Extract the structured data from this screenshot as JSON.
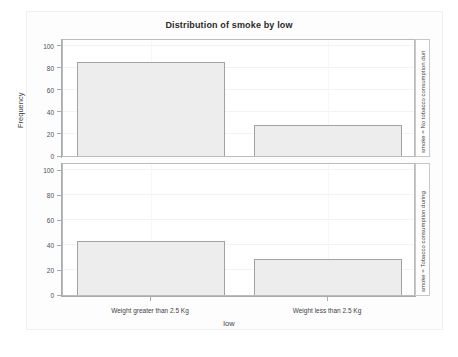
{
  "chart_data": {
    "type": "bar",
    "title": "Distribution of smoke by low",
    "xlabel": "low",
    "ylabel": "Frequency",
    "categories": [
      "Weight greater than 2.5 Kg",
      "Weight less than 2.5 Kg"
    ],
    "ylim": [
      0,
      105
    ],
    "yticks": [
      0,
      20,
      40,
      60,
      80,
      100
    ],
    "ytick_labels": [
      "0",
      "20",
      "40",
      "60",
      "80",
      "100"
    ],
    "grid": true,
    "legend": "none",
    "layout": "vertical-facets",
    "panels": [
      {
        "strip_label": "smoke = No tobacco consumption duri",
        "values": [
          85,
          28
        ]
      },
      {
        "strip_label": "smoke = Tobacco consumption during",
        "values": [
          43,
          29
        ]
      }
    ],
    "series": [
      {
        "name": "smoke = No tobacco consumption duri",
        "values": [
          85,
          28
        ]
      },
      {
        "name": "smoke = Tobacco consumption during",
        "values": [
          43,
          29
        ]
      }
    ],
    "colors": {
      "bar_fill": "#ededee",
      "bar_border": "#9fa3a6",
      "axis": "#a9acae",
      "grid": "#f2f3f4",
      "text": "#3f4245",
      "panel_border": "#b9bcbe",
      "background": "#ffffff"
    }
  }
}
